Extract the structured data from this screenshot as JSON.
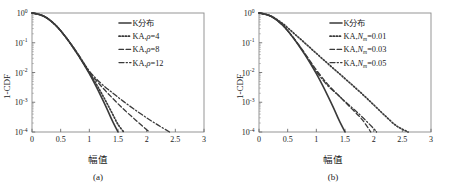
{
  "figure": {
    "panels": [
      {
        "id": "a",
        "caption": "(a)",
        "xlabel": "幅值",
        "ylabel": "1-CDF",
        "xticks": [
          "0",
          "0.5",
          "1",
          "1.5",
          "2",
          "2.5",
          "3"
        ],
        "yticks": [
          "10",
          "10",
          "10",
          "10",
          "10"
        ],
        "yexp": [
          "0",
          "-1",
          "-2",
          "-3",
          "-4"
        ],
        "legend": [
          {
            "label": "K分布",
            "style": "solid"
          },
          {
            "label": "KA,",
            "sym": "ρ",
            "sub": "",
            "eq": "=4",
            "style": "dotted"
          },
          {
            "label": "KA,",
            "sym": "ρ",
            "sub": "",
            "eq": "=8",
            "style": "dashed"
          },
          {
            "label": "KA,",
            "sym": "ρ",
            "sub": "",
            "eq": "=12",
            "style": "dashdot"
          }
        ]
      },
      {
        "id": "b",
        "caption": "(b)",
        "xlabel": "幅值",
        "ylabel": "1-CDF",
        "xticks": [
          "0",
          "0.5",
          "1",
          "1.5",
          "2",
          "2.5",
          "3"
        ],
        "yticks": [
          "10",
          "10",
          "10",
          "10",
          "10"
        ],
        "yexp": [
          "0",
          "-1",
          "-2",
          "-3",
          "-4"
        ],
        "legend": [
          {
            "label": "K分布",
            "style": "solid"
          },
          {
            "label": "KA,",
            "sym": "N",
            "sub": "m",
            "eq": "=0.01",
            "style": "dotted"
          },
          {
            "label": "KA,",
            "sym": "N",
            "sub": "m",
            "eq": "=0.03",
            "style": "dashed"
          },
          {
            "label": "KA,",
            "sym": "N",
            "sub": "m",
            "eq": "=0.05",
            "style": "dashdot"
          }
        ]
      }
    ]
  },
  "chart_data": [
    {
      "type": "line",
      "panel": "(a)",
      "title": "",
      "xlabel": "幅值",
      "ylabel": "1-CDF",
      "xlim": [
        0,
        3
      ],
      "ylim": [
        0.0001,
        1
      ],
      "yscale": "log",
      "grid": false,
      "legend_position": "top-right",
      "series": [
        {
          "name": "K分布",
          "style": "solid",
          "x": [
            0,
            0.1,
            0.2,
            0.3,
            0.4,
            0.5,
            0.6,
            0.7,
            0.8,
            0.9,
            1.0,
            1.1,
            1.2,
            1.3,
            1.4,
            1.5
          ],
          "y": [
            1.0,
            0.93,
            0.79,
            0.6,
            0.41,
            0.255,
            0.145,
            0.078,
            0.04,
            0.0195,
            0.0091,
            0.004,
            0.00165,
            0.00065,
            0.00024,
            0.0001
          ]
        },
        {
          "name": "KA,ρ=4",
          "style": "dotted",
          "x": [
            0,
            0.2,
            0.4,
            0.6,
            0.8,
            1.0,
            1.1,
            1.2,
            1.3,
            1.4,
            1.5,
            1.6
          ],
          "y": [
            1.0,
            0.79,
            0.41,
            0.145,
            0.04,
            0.0098,
            0.0048,
            0.0022,
            0.00098,
            0.00042,
            0.00018,
            0.0001
          ]
        },
        {
          "name": "KA,ρ=8",
          "style": "dashed",
          "x": [
            0,
            0.2,
            0.4,
            0.6,
            0.8,
            1.0,
            1.2,
            1.4,
            1.6,
            1.8,
            2.0,
            2.05
          ],
          "y": [
            1.0,
            0.79,
            0.41,
            0.145,
            0.042,
            0.0105,
            0.0036,
            0.0014,
            0.00058,
            0.00026,
            0.00012,
            0.0001
          ]
        },
        {
          "name": "KA,ρ=12",
          "style": "dashdot",
          "x": [
            0,
            0.2,
            0.4,
            0.6,
            0.8,
            1.0,
            1.2,
            1.4,
            1.6,
            1.8,
            2.0,
            2.2,
            2.4
          ],
          "y": [
            1.0,
            0.79,
            0.41,
            0.145,
            0.043,
            0.0112,
            0.0044,
            0.0021,
            0.00105,
            0.00055,
            0.0003,
            0.00017,
            0.0001
          ]
        }
      ]
    },
    {
      "type": "line",
      "panel": "(b)",
      "title": "",
      "xlabel": "幅值",
      "ylabel": "1-CDF",
      "xlim": [
        0,
        3
      ],
      "ylim": [
        0.0001,
        1
      ],
      "yscale": "log",
      "grid": false,
      "legend_position": "top-right",
      "series": [
        {
          "name": "K分布",
          "style": "solid",
          "x": [
            0,
            0.1,
            0.2,
            0.3,
            0.4,
            0.5,
            0.6,
            0.7,
            0.8,
            0.9,
            1.0,
            1.1,
            1.2,
            1.3,
            1.4,
            1.5
          ],
          "y": [
            1.0,
            0.93,
            0.79,
            0.6,
            0.41,
            0.255,
            0.145,
            0.078,
            0.04,
            0.0195,
            0.0091,
            0.004,
            0.00165,
            0.00065,
            0.00024,
            0.0001
          ]
        },
        {
          "name": "KA,Nm=0.01",
          "style": "dotted",
          "x": [
            0,
            0.2,
            0.4,
            0.6,
            0.8,
            1.0,
            1.2,
            1.4,
            1.6,
            1.8,
            2.0,
            2.2,
            2.4,
            2.6
          ],
          "y": [
            1.0,
            0.8,
            0.46,
            0.215,
            0.098,
            0.044,
            0.02,
            0.0092,
            0.0042,
            0.0019,
            0.00082,
            0.00035,
            0.00016,
            0.0001
          ]
        },
        {
          "name": "KA,Nm=0.03",
          "style": "dashed",
          "x": [
            0,
            0.2,
            0.4,
            0.6,
            0.8,
            1.0,
            1.2,
            1.4,
            1.6,
            1.8,
            1.95
          ],
          "y": [
            1.0,
            0.79,
            0.41,
            0.148,
            0.044,
            0.0122,
            0.004,
            0.0016,
            0.00065,
            0.00026,
            0.0001
          ]
        },
        {
          "name": "KA,Nm=0.05",
          "style": "dashdot",
          "x": [
            0,
            0.2,
            0.4,
            0.6,
            0.8,
            1.0,
            1.2,
            1.4,
            1.6,
            1.8,
            2.0,
            2.05
          ],
          "y": [
            1.0,
            0.79,
            0.41,
            0.146,
            0.042,
            0.0108,
            0.0036,
            0.0016,
            0.00072,
            0.00032,
            0.00013,
            0.0001
          ]
        }
      ]
    }
  ]
}
